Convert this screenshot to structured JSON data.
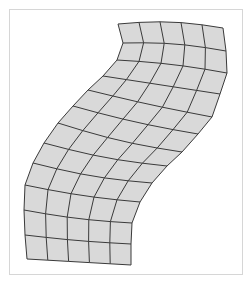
{
  "diagram": {
    "type": "deformed-grid-mesh",
    "columns": 5,
    "rows": 12,
    "fill_color": "#d9d9d9",
    "line_color": "#3a3a3a",
    "frame_color": "#d6d6d6",
    "left_edge": [
      [
        118,
        24
      ],
      [
        123,
        43
      ],
      [
        117,
        60
      ],
      [
        103,
        76
      ],
      [
        88,
        90
      ],
      [
        73,
        106
      ],
      [
        58,
        123
      ],
      [
        44,
        143
      ],
      [
        33,
        163
      ],
      [
        25,
        185
      ],
      [
        24,
        210
      ],
      [
        25,
        235
      ],
      [
        27,
        259
      ]
    ],
    "right_edge": [
      [
        223,
        28
      ],
      [
        226,
        51
      ],
      [
        227,
        73
      ],
      [
        220,
        94
      ],
      [
        212,
        117
      ],
      [
        198,
        134
      ],
      [
        182,
        152
      ],
      [
        167,
        166
      ],
      [
        152,
        183
      ],
      [
        140,
        202
      ],
      [
        132,
        223
      ],
      [
        131,
        244
      ],
      [
        131,
        265
      ]
    ],
    "bow": [
      -4,
      -3,
      -2,
      0,
      1,
      2,
      3,
      3,
      3,
      2,
      2,
      1,
      0
    ]
  }
}
